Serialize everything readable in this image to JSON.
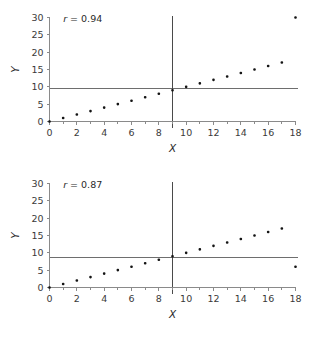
{
  "figure": {
    "background": "#ffffff",
    "marker_color": "#141414",
    "axis_color": "#8a8a8a",
    "reference_line_color": "#6e6e6e",
    "divider_line_color": "#4a4a4a"
  },
  "chart_data": [
    {
      "type": "scatter",
      "panel": "top",
      "title": "",
      "xlabel": "X",
      "ylabel": "Y",
      "xlim": [
        0,
        18
      ],
      "ylim": [
        0,
        30
      ],
      "xticks": [
        0,
        2,
        4,
        6,
        8,
        10,
        12,
        14,
        16,
        18
      ],
      "xtick_labels": [
        "0",
        "2",
        "4",
        "6",
        "8",
        "10",
        "12",
        "14",
        "16",
        "18"
      ],
      "xminor_step": 1,
      "yticks": [
        0,
        5,
        10,
        15,
        20,
        25,
        30
      ],
      "ytick_labels": [
        "0",
        "5",
        "10",
        "15",
        "20",
        "25",
        "30"
      ],
      "grid": false,
      "legend": null,
      "annotations": [
        {
          "name": "correlation-label",
          "text_italic": "r",
          "text": " = 0.94",
          "x": 1.0,
          "y": 28.6
        }
      ],
      "reference_lines": [
        {
          "orientation": "horizontal",
          "value": 9.4,
          "name": "mean-y-line"
        },
        {
          "orientation": "vertical",
          "value": 9.0,
          "name": "mean-x-line"
        }
      ],
      "x": [
        0,
        1,
        2,
        3,
        4,
        5,
        6,
        7,
        8,
        9,
        10,
        11,
        12,
        13,
        14,
        15,
        16,
        17,
        18
      ],
      "y": [
        0,
        1,
        2,
        3,
        4,
        5,
        6,
        7,
        8,
        9,
        10,
        11,
        12,
        13,
        14,
        15,
        16,
        17,
        30
      ]
    },
    {
      "type": "scatter",
      "panel": "bottom",
      "title": "",
      "xlabel": "X",
      "ylabel": "Y",
      "xlim": [
        0,
        18
      ],
      "ylim": [
        0,
        30
      ],
      "xticks": [
        0,
        2,
        4,
        6,
        8,
        10,
        12,
        14,
        16,
        18
      ],
      "xtick_labels": [
        "0",
        "2",
        "4",
        "6",
        "8",
        "10",
        "12",
        "14",
        "16",
        "18"
      ],
      "xminor_step": 1,
      "yticks": [
        0,
        5,
        10,
        15,
        20,
        25,
        30
      ],
      "ytick_labels": [
        "0",
        "5",
        "10",
        "15",
        "20",
        "25",
        "30"
      ],
      "grid": false,
      "legend": null,
      "annotations": [
        {
          "name": "correlation-label",
          "text_italic": "r",
          "text": " = 0.87",
          "x": 1.0,
          "y": 28.6
        }
      ],
      "reference_lines": [
        {
          "orientation": "horizontal",
          "value": 8.7,
          "name": "mean-y-line"
        },
        {
          "orientation": "vertical",
          "value": 9.0,
          "name": "mean-x-line"
        }
      ],
      "x": [
        0,
        1,
        2,
        3,
        4,
        5,
        6,
        7,
        8,
        9,
        10,
        11,
        12,
        13,
        14,
        15,
        16,
        17,
        18
      ],
      "y": [
        0,
        1,
        2,
        3,
        4,
        5,
        6,
        7,
        8,
        9,
        10,
        11,
        12,
        13,
        14,
        15,
        16,
        17,
        6
      ]
    }
  ]
}
